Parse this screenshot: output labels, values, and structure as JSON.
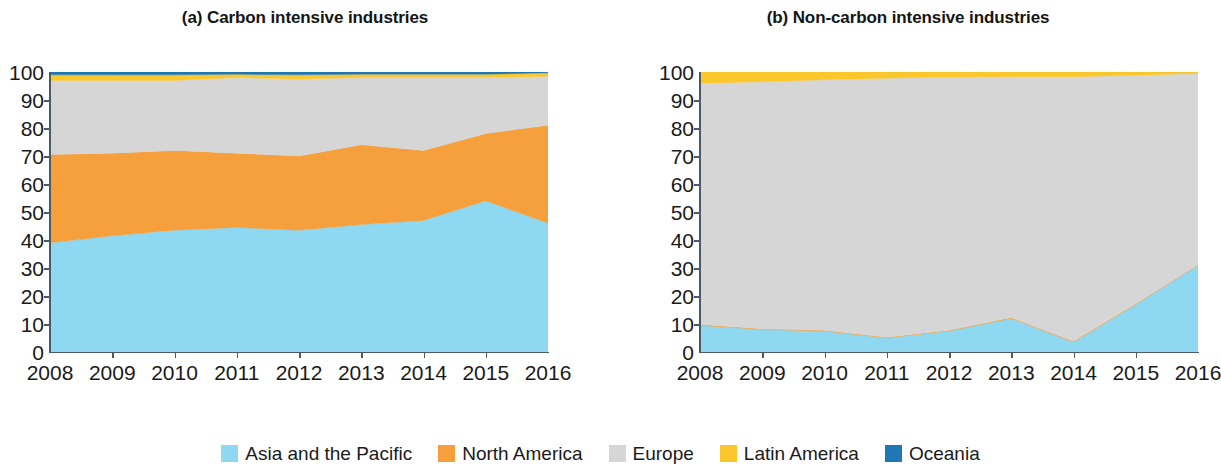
{
  "figure": {
    "panels": [
      {
        "title": "(a) Carbon intensive industries"
      },
      {
        "title": "(b) Non-carbon intensive industries"
      }
    ]
  },
  "legend": {
    "position": "bottom-center",
    "items": [
      {
        "label": "Asia and the Pacific",
        "color": "#8ed8f2"
      },
      {
        "label": "North America",
        "color": "#f5a03c"
      },
      {
        "label": "Europe",
        "color": "#d6d6d6"
      },
      {
        "label": "Latin America",
        "color": "#fbc72b"
      },
      {
        "label": "Oceania",
        "color": "#1f77b4"
      }
    ]
  },
  "axes": {
    "yticks": [
      "100",
      "90",
      "80",
      "70",
      "60",
      "50",
      "40",
      "30",
      "20",
      "10",
      "0"
    ],
    "xticks": [
      "2008",
      "2009",
      "2010",
      "2011",
      "2012",
      "2013",
      "2014",
      "2015",
      "2016"
    ]
  },
  "chart_data": [
    {
      "type": "area",
      "stacked": true,
      "title": "(a) Carbon intensive industries",
      "xlabel": "",
      "ylabel": "",
      "ylim": [
        0,
        100
      ],
      "grid": false,
      "legend_position": "bottom-center",
      "x": [
        2008,
        2009,
        2010,
        2011,
        2012,
        2013,
        2014,
        2015,
        2016
      ],
      "series": [
        {
          "name": "Asia and the Pacific",
          "color": "#8ed8f2",
          "values": [
            39.0,
            41.5,
            43.5,
            44.5,
            43.5,
            45.5,
            47.0,
            54.0,
            46.0
          ]
        },
        {
          "name": "North America",
          "color": "#f5a03c",
          "values": [
            31.5,
            29.5,
            28.5,
            26.5,
            26.5,
            28.5,
            25.0,
            24.0,
            35.0
          ]
        },
        {
          "name": "Europe",
          "color": "#d6d6d6",
          "values": [
            26.5,
            26.0,
            25.0,
            27.0,
            27.5,
            24.0,
            26.0,
            20.0,
            17.5
          ]
        },
        {
          "name": "Latin America",
          "color": "#fbc72b",
          "values": [
            2.0,
            2.0,
            2.0,
            1.2,
            1.5,
            1.2,
            1.2,
            1.2,
            1.2
          ]
        },
        {
          "name": "Oceania",
          "color": "#1f77b4",
          "values": [
            1.0,
            1.0,
            1.0,
            0.8,
            1.0,
            0.8,
            0.8,
            0.8,
            0.3
          ]
        }
      ]
    },
    {
      "type": "area",
      "stacked": true,
      "title": "(b) Non-carbon intensive industries",
      "xlabel": "",
      "ylabel": "",
      "ylim": [
        0,
        100
      ],
      "grid": false,
      "legend_position": "bottom-center",
      "x": [
        2008,
        2009,
        2010,
        2011,
        2012,
        2013,
        2014,
        2015,
        2016
      ],
      "series": [
        {
          "name": "Asia and the Pacific",
          "color": "#8ed8f2",
          "values": [
            9.5,
            8.0,
            7.5,
            5.0,
            7.5,
            12.0,
            3.5,
            17.0,
            31.0
          ]
        },
        {
          "name": "North America",
          "color": "#f5a03c",
          "values": [
            0.3,
            0.3,
            0.3,
            0.3,
            0.3,
            0.3,
            0.3,
            0.2,
            0.2
          ]
        },
        {
          "name": "Europe",
          "color": "#d6d6d6",
          "values": [
            86.2,
            88.2,
            89.4,
            92.5,
            90.4,
            86.0,
            94.5,
            81.6,
            68.3
          ]
        },
        {
          "name": "Latin America",
          "color": "#fbc72b",
          "values": [
            4.0,
            3.5,
            2.8,
            2.2,
            1.8,
            1.7,
            1.7,
            1.2,
            0.5
          ]
        },
        {
          "name": "Oceania",
          "color": "#1f77b4",
          "values": [
            0.0,
            0.0,
            0.0,
            0.0,
            0.0,
            0.0,
            0.0,
            0.0,
            0.0
          ]
        }
      ]
    }
  ]
}
